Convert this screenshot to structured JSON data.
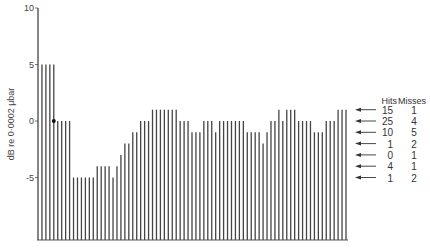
{
  "chart_data": {
    "type": "bar",
    "title": "",
    "xlabel": "",
    "ylabel": "dB re 0·0002 μbar",
    "ylim": [
      -10.5,
      10
    ],
    "yticks": [
      10,
      5,
      0,
      -5
    ],
    "ytick_labels": [
      "10",
      "5",
      "0",
      "-5"
    ],
    "grid": false,
    "marker": {
      "bar_index": 4,
      "value": 0,
      "label": "dot"
    },
    "values": [
      10,
      5,
      5,
      5,
      5,
      0,
      0,
      0,
      0,
      -5,
      -5,
      -5,
      -5,
      -5,
      -5,
      -4,
      -4,
      -4,
      -4,
      -5,
      -4,
      -3,
      -2,
      -2,
      -1,
      -1,
      0,
      0,
      0,
      1,
      1,
      1,
      1,
      1,
      1,
      1,
      0,
      0,
      0,
      -1,
      -1,
      -1,
      0,
      0,
      0,
      -1,
      0,
      0,
      0,
      0,
      0,
      0,
      0,
      -1,
      -1,
      -1,
      -1,
      -2,
      -1,
      0,
      0,
      1,
      0,
      1,
      1,
      1,
      0,
      0,
      0,
      0,
      -1,
      -1,
      -1,
      0,
      0,
      0,
      1,
      1,
      1
    ],
    "legend": {
      "placement": "right",
      "headers": [
        "Hits",
        "Misses"
      ],
      "rows": [
        {
          "level": 1,
          "hits": "15",
          "misses": "1"
        },
        {
          "level": 0,
          "hits": "25",
          "misses": "4"
        },
        {
          "level": -1,
          "hits": "10",
          "misses": "5"
        },
        {
          "level": -2,
          "hits": "1",
          "misses": "2"
        },
        {
          "level": -3,
          "hits": "0",
          "misses": "1"
        },
        {
          "level": -4,
          "hits": "4",
          "misses": "1"
        },
        {
          "level": -5,
          "hits": "1",
          "misses": "2"
        }
      ]
    }
  }
}
